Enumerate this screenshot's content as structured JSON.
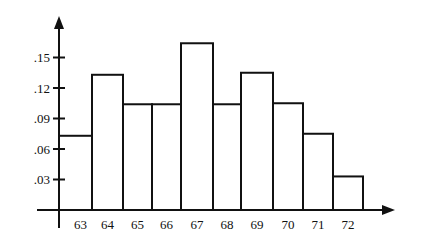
{
  "chart_data": {
    "type": "bar",
    "subtype": "histogram",
    "title": "",
    "xlabel": "",
    "ylabel": "",
    "categories": [
      "63",
      "64",
      "65",
      "66",
      "67",
      "68",
      "69",
      "70",
      "71",
      "72"
    ],
    "values": [
      0.073,
      0.133,
      0.104,
      0.104,
      0.164,
      0.104,
      0.135,
      0.105,
      0.075,
      0.033
    ],
    "yticks": [
      ".03",
      ".06",
      ".09",
      ".12",
      ".15"
    ],
    "ytick_values": [
      0.03,
      0.06,
      0.09,
      0.12,
      0.15
    ],
    "ylim": [
      0,
      0.19
    ],
    "grid": false,
    "legend": null,
    "bar_fill": "#ffffff",
    "bar_stroke": "#111111"
  }
}
